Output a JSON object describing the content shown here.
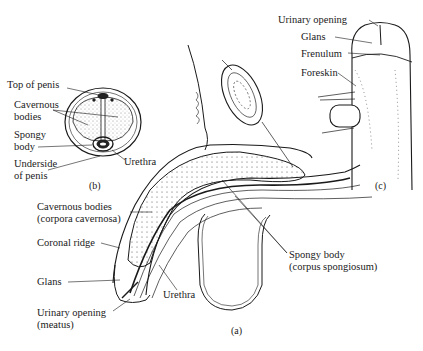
{
  "figure": {
    "panel_a": {
      "caption": "(a)",
      "labels": {
        "cavernous_1": "Cavernous bodies",
        "cavernous_2": "(corpora cavernosa)",
        "coronal_ridge": "Coronal ridge",
        "glans": "Glans",
        "urinary_1": "Urinary opening",
        "urinary_2": "(meatus)",
        "urethra": "Urethra",
        "spongy_1": "Spongy body",
        "spongy_2": "(corpus spongiosum)"
      }
    },
    "panel_b": {
      "caption": "(b)",
      "labels": {
        "top": "Top of penis",
        "cavernous_1": "Cavernous",
        "cavernous_2": "bodies",
        "spongy_1": "Spongy",
        "spongy_2": "body",
        "underside_1": "Underside",
        "underside_2": "of penis",
        "urethra": "Urethra"
      }
    },
    "panel_c": {
      "caption": "(c)",
      "labels": {
        "urinary": "Urinary opening",
        "glans": "Glans",
        "frenulum": "Frenulum",
        "foreskin": "Foreskin"
      }
    },
    "colors": {
      "ink": "#1a1a1a",
      "background": "#ffffff"
    }
  }
}
